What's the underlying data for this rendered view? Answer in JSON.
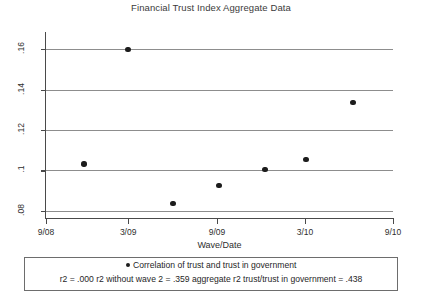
{
  "chart_data": {
    "type": "scatter",
    "title": "Financial Trust Index Aggregate Data",
    "xlabel": "Wave/Date",
    "ylabel": "",
    "x_tick_labels": [
      "9/08",
      "3/09",
      "9/09",
      "3/10",
      "9/10"
    ],
    "x_tick_positions": [
      0,
      0.2368,
      0.4928,
      0.7464,
      1.0
    ],
    "y_tick_labels": [
      ".16",
      ".14",
      ".12",
      ".1",
      ".08"
    ],
    "y_tick_values": [
      0.16,
      0.14,
      0.12,
      0.1,
      0.08
    ],
    "ylim": [
      0.0765,
      0.1645
    ],
    "xlim": [
      0,
      1
    ],
    "grid": true,
    "legend_position": "below-axes",
    "series": [
      {
        "name": "Correlation of trust and trust in government",
        "marker": "filled-circle",
        "color": "#1c1c1c",
        "points": [
          {
            "x_label": "12/08",
            "x": 0.1095,
            "y": 0.1032
          },
          {
            "x_label": "3/09",
            "x": 0.2368,
            "y": 0.1597
          },
          {
            "x_label": "6/09",
            "x": 0.366,
            "y": 0.0838
          },
          {
            "x_label": "9/09",
            "x": 0.4986,
            "y": 0.0926
          },
          {
            "x_label": "12/09",
            "x": 0.6311,
            "y": 0.1005
          },
          {
            "x_label": "3/10",
            "x": 0.7493,
            "y": 0.1055
          },
          {
            "x_label": "6/10",
            "x": 0.8847,
            "y": 0.1336
          }
        ]
      }
    ],
    "annotations": {
      "legend_entry": "Correlation of trust and trust in government",
      "stats_line": "r2 = .000  r2 without wave 2 = .359  aggregate r2 trust/trust in government =  .438",
      "r2": ".000",
      "r2_without_wave_2": ".359",
      "aggregate_r2_trust_trust_in_government": ".438"
    }
  },
  "colors": {
    "marker": "#1c1c1c",
    "gridline": "#8d8d8d",
    "axis": "#4a4a4a",
    "background": "#ffffff",
    "text": "#2e2e2e"
  }
}
